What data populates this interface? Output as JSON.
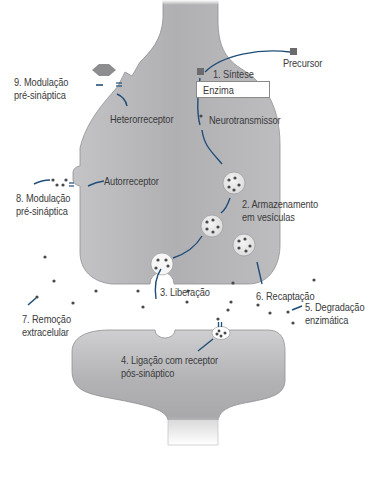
{
  "diagram": {
    "type": "synapse-neurotransmission",
    "colors": {
      "neuron_fill": "#b4b4b6",
      "neuron_edge": "#8f8f93",
      "arrow": "#1f4e79",
      "dot": "#4a4a4a",
      "text": "#3a3a3a"
    },
    "labels": {
      "synthesis": "1. Síntese",
      "precursor": "Precursor",
      "enzyme": "Enzima",
      "neurotransmitter": "Neurotransmissor",
      "storage_line1": "2. Armazenamento",
      "storage_line2": "em vesículas",
      "release": "3. Liberação",
      "binding_line1": "4. Ligação com receptor",
      "binding_line2": "pós-sináptico",
      "degradation_line1": "5. Degradação",
      "degradation_line2": "enzimática",
      "reuptake": "6. Recaptação",
      "removal_line1": "7. Remoção",
      "removal_line2": "extracelular",
      "auto_modulation_line1": "8. Modulação",
      "auto_modulation_line2": "pré-sináptica",
      "autoreceptor": "Autorreceptor",
      "hetero_modulation_line1": "9. Modulação",
      "hetero_modulation_line2": "pré-sináptica",
      "heteroreceptor": "Heterorreceptor"
    }
  }
}
